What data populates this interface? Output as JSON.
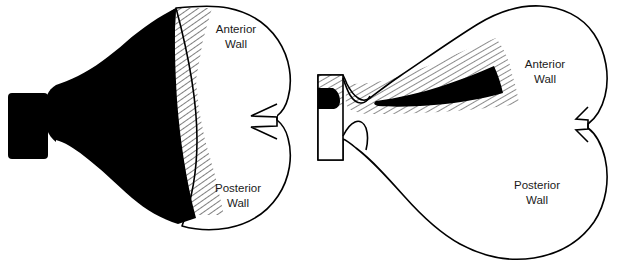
{
  "figure": {
    "background_color": "#ffffff",
    "ink_color": "#000000",
    "width": 623,
    "height": 274,
    "panel_count": 2
  },
  "panels": [
    {
      "id": "left-panel",
      "name": "distended-uterine-cavity",
      "description": "Sagittal section of uterus with a large, wedge-shaped black uterine cavity filling most of the corpus, bordered on the right by a narrow hatched myometrial band.",
      "cavity_fill": "#000000",
      "myometrium_hatch": true,
      "outline_color": "#000000",
      "labels": {
        "anterior": {
          "line1": "Anterior",
          "line2": "Wall",
          "x": 236,
          "y": 34
        },
        "posterior": {
          "line1": "Posterior",
          "line2": "Wall",
          "x": 238,
          "y": 193
        }
      },
      "features": [
        {
          "name": "cervical-canal",
          "fill": "#000000"
        },
        {
          "name": "internal-os-isthmus",
          "fill": "#000000"
        },
        {
          "name": "uterine-cavity",
          "fill": "#000000"
        },
        {
          "name": "myometrium-hatched-band",
          "fill": "hatch"
        },
        {
          "name": "cornu-tubal-ostium-notch",
          "fill": "none"
        },
        {
          "name": "fundus-outline",
          "fill": "none"
        }
      ]
    },
    {
      "id": "right-panel",
      "name": "collapsed-uterine-cavity",
      "description": "Sagittal section of uterus with a thin, slit-like black uterine cavity surrounded by a broad hatched endometrial/myometrial zone.",
      "cavity_fill": "#000000",
      "myometrium_hatch": true,
      "outline_color": "#000000",
      "labels": {
        "anterior": {
          "line1": "Anterior",
          "line2": "Wall",
          "x": 545,
          "y": 69
        },
        "posterior": {
          "line1": "Posterior",
          "line2": "Wall",
          "x": 537,
          "y": 190
        }
      },
      "features": [
        {
          "name": "cervical-canal",
          "fill": "#000000"
        },
        {
          "name": "internal-os-isthmus",
          "fill": "none"
        },
        {
          "name": "uterine-cavity-slit",
          "fill": "#000000"
        },
        {
          "name": "endometrium-hatched-zone",
          "fill": "hatch"
        },
        {
          "name": "cornu-tubal-ostium-notch",
          "fill": "none"
        },
        {
          "name": "fundus-outline",
          "fill": "none"
        }
      ]
    }
  ],
  "caption": {
    "text": "",
    "visible": false,
    "note": "A line of text is cropped at the very bottom edge and is illegible."
  }
}
